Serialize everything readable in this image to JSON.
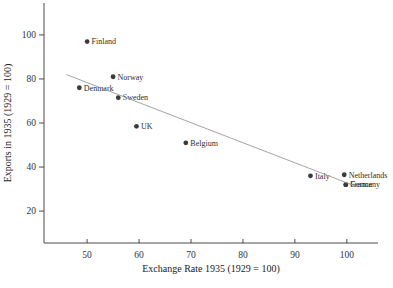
{
  "figure": {
    "background": "#ffffff"
  },
  "chart_data": {
    "type": "scatter",
    "title": "",
    "xlabel": "Exchange Rate 1935 (1929 = 100)",
    "ylabel": "Exports in 1935 (1929 = 100)",
    "xlim": [
      41.7,
      106.0
    ],
    "ylim": [
      5.5,
      114.5
    ],
    "x_ticks": [
      50,
      60,
      70,
      80,
      90,
      100
    ],
    "y_ticks": [
      20,
      40,
      60,
      80,
      100
    ],
    "grid": false,
    "legend": "none",
    "points": [
      {
        "label": "Denmark",
        "x": 48.5,
        "y": 76.0
      },
      {
        "label": "Finland",
        "x": 50.0,
        "y": 97.0
      },
      {
        "label": "Norway",
        "x": 55.0,
        "y": 81.0
      },
      {
        "label": "Sweden",
        "x": 56.0,
        "y": 71.5
      },
      {
        "label": "UK",
        "x": 59.5,
        "y": 58.5
      },
      {
        "label": "Belgium",
        "x": 69.0,
        "y": 51.0
      },
      {
        "label": "Italy",
        "x": 93.0,
        "y": 36.0
      },
      {
        "label": "Netherlands",
        "x": 99.5,
        "y": 36.5
      },
      {
        "label": "Germany",
        "x": 99.8,
        "y": 32.0
      },
      {
        "label": "France",
        "x": 99.8,
        "y": 32.0
      }
    ],
    "trend_line": {
      "x1": 46.0,
      "y1": 82.0,
      "x2": 102.0,
      "y2": 31.0
    },
    "colors": {
      "point": "#3a3a3a",
      "point_label": "#2e2e2e",
      "trend_line": "#9a9a9a",
      "axis": "#4a4a4a",
      "tick_text": "#333333",
      "axis_title": "#222222"
    }
  }
}
